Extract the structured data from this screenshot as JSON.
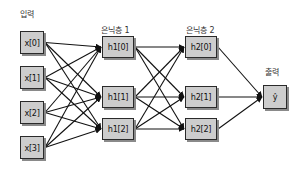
{
  "diagram": {
    "type": "feedforward-neural-network",
    "layers": [
      {
        "id": "input",
        "label": "입력",
        "nodes": [
          "x[0]",
          "x[1]",
          "x[2]",
          "x[3]"
        ]
      },
      {
        "id": "hidden1",
        "label": "은닉층 1",
        "nodes": [
          "h1[0]",
          "h1[1]",
          "h1[2]"
        ]
      },
      {
        "id": "hidden2",
        "label": "은닉층 2",
        "nodes": [
          "h2[0]",
          "h2[1]",
          "h2[2]"
        ]
      },
      {
        "id": "output",
        "label": "출력",
        "nodes": [
          "ŷ"
        ]
      }
    ],
    "connections": "fully-connected",
    "colors": {
      "node_fill": "#cdcdcd",
      "node_border": "#2a2a2a",
      "edge": "#111111",
      "shadow": "#8a8a8a"
    }
  }
}
